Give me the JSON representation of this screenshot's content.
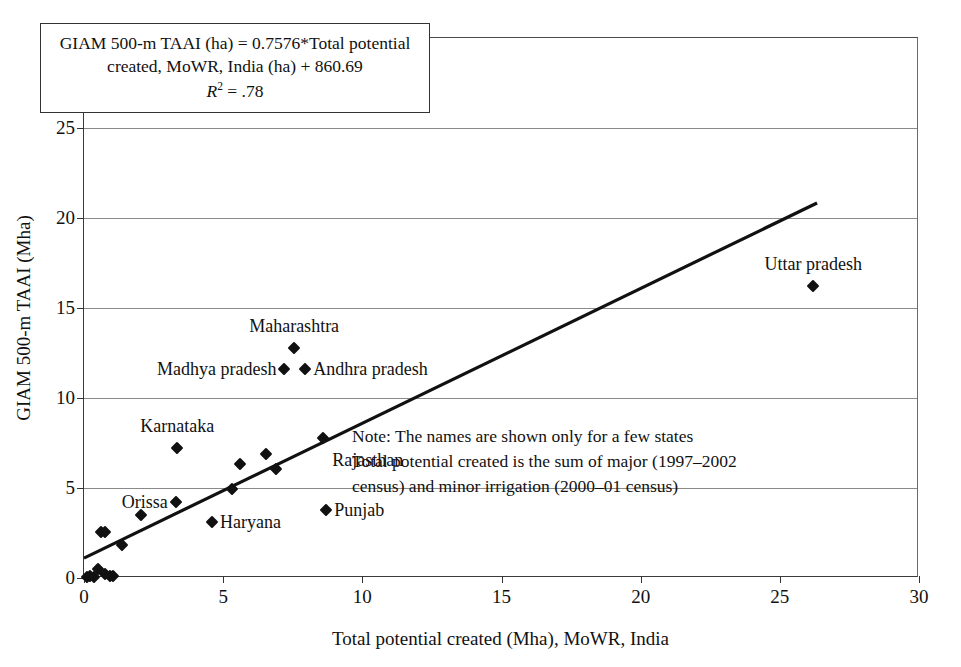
{
  "chart_data": {
    "type": "scatter",
    "title": "",
    "xlabel": "Total potential created (Mha), MoWR, India",
    "ylabel": "GIAM 500-m TAAI (Mha)",
    "xlim": [
      0,
      30
    ],
    "ylim": [
      0,
      30
    ],
    "xticks": [
      0,
      5,
      10,
      15,
      20,
      25,
      30
    ],
    "yticks": [
      0,
      5,
      10,
      15,
      20,
      25,
      30
    ],
    "grid": "horizontal",
    "legend": "none",
    "equation": {
      "line1": "GIAM 500-m TAAI (ha) = 0.7576*Total",
      "line2": "potential created, MoWR, India (ha) + 860.69",
      "r2_symbol": "R",
      "r2_exponent": "2",
      "r2_value": "= .78",
      "slope": 0.7576,
      "intercept": 860.69,
      "r_squared": 0.78
    },
    "trendline": {
      "x_start": 0,
      "y_start": 1.0,
      "x_end": 26.4,
      "y_end": 20.8
    },
    "points": [
      {
        "x": 0.1,
        "y": 0.05,
        "label": ""
      },
      {
        "x": 0.22,
        "y": 0.1,
        "label": ""
      },
      {
        "x": 0.35,
        "y": 0.05,
        "label": ""
      },
      {
        "x": 0.5,
        "y": 0.5,
        "label": ""
      },
      {
        "x": 0.75,
        "y": 0.25,
        "label": ""
      },
      {
        "x": 0.95,
        "y": 0.1,
        "label": ""
      },
      {
        "x": 1.05,
        "y": 0.1,
        "label": ""
      },
      {
        "x": 0.6,
        "y": 2.55,
        "label": ""
      },
      {
        "x": 0.75,
        "y": 2.55,
        "label": ""
      },
      {
        "x": 1.35,
        "y": 1.85,
        "label": ""
      },
      {
        "x": 2.05,
        "y": 3.5,
        "label": ""
      },
      {
        "x": 3.3,
        "y": 4.25,
        "label": "Orissa",
        "label_pos": "left"
      },
      {
        "x": 3.35,
        "y": 7.25,
        "label": "Karnataka",
        "label_pos": "above"
      },
      {
        "x": 4.6,
        "y": 3.1,
        "label": "Haryana",
        "label_pos": "right"
      },
      {
        "x": 5.3,
        "y": 4.95,
        "label": ""
      },
      {
        "x": 5.6,
        "y": 6.35,
        "label": ""
      },
      {
        "x": 6.55,
        "y": 6.9,
        "label": ""
      },
      {
        "x": 6.9,
        "y": 6.05,
        "label": ""
      },
      {
        "x": 7.2,
        "y": 11.6,
        "label": "Madhya pradesh",
        "label_pos": "left"
      },
      {
        "x": 7.55,
        "y": 12.8,
        "label": "Maharashtra",
        "label_pos": "above"
      },
      {
        "x": 7.95,
        "y": 11.6,
        "label": "Andhra pradesh",
        "label_pos": "right"
      },
      {
        "x": 8.6,
        "y": 7.8,
        "label": "Rajasthan",
        "label_pos": "below-right"
      },
      {
        "x": 8.7,
        "y": 3.8,
        "label": "Punjab",
        "label_pos": "right"
      },
      {
        "x": 26.2,
        "y": 16.25,
        "label": "Uttar pradesh",
        "label_pos": "above"
      }
    ],
    "note": {
      "line1": "Note: The names are shown only for a few states",
      "line2": "Total potential created is the sum of major (1997–2002",
      "line3": "census)  and minor irrigation (2000–01 census)"
    }
  }
}
